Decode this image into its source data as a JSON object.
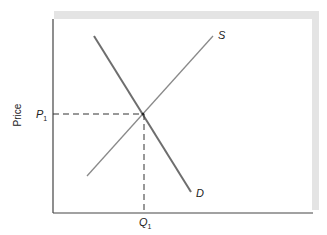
{
  "diagram": {
    "type": "supply-demand",
    "y_axis_label": "Price",
    "price_label": "P",
    "price_sub": "1",
    "quantity_label": "Q",
    "quantity_sub": "1",
    "supply_label": "S",
    "demand_label": "D",
    "colors": {
      "frame": "#e4e4e4",
      "axis": "#444444",
      "supply": "#8a8a8a",
      "demand": "#6e6e6e",
      "dash": "#333333"
    }
  }
}
